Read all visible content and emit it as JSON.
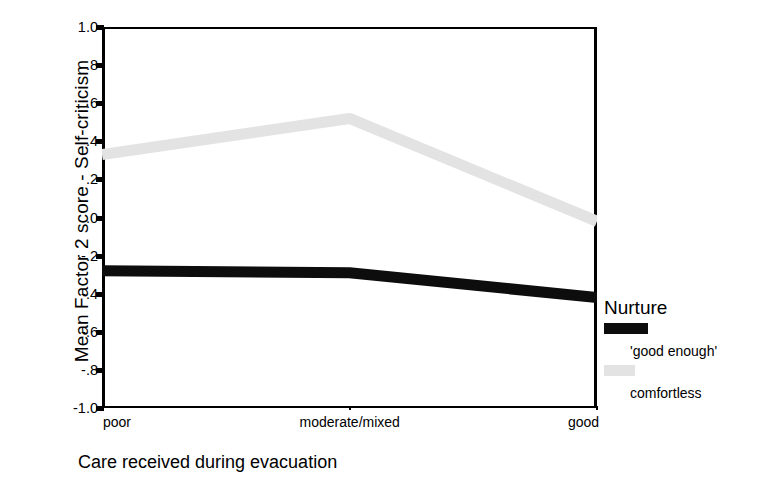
{
  "chart_data": {
    "type": "line",
    "title": "",
    "xlabel": "Care received during evacuation",
    "ylabel": "Mean Factor 2 score - Self-criticism",
    "categories": [
      "poor",
      "moderate/mixed",
      "good"
    ],
    "ylim": [
      -1.0,
      1.0
    ],
    "ytick_labels": [
      "1.0",
      ".8",
      ".6",
      ".4",
      ".2",
      ".0",
      "-.2",
      "-.4",
      "-.6",
      "-.8",
      "-1.0"
    ],
    "ytick_values": [
      1.0,
      0.8,
      0.6,
      0.4,
      0.2,
      0.0,
      -0.2,
      -0.4,
      -0.6,
      -0.8,
      -1.0
    ],
    "grid": false,
    "legend_position": "right",
    "legend_title": "Nurture",
    "series": [
      {
        "name": "'good enough'",
        "color": "#0d0d0d",
        "values": [
          -0.28,
          -0.29,
          -0.42
        ]
      },
      {
        "name": "comfortless",
        "color": "#e3e3e3",
        "values": [
          0.33,
          0.52,
          -0.02
        ]
      }
    ]
  },
  "axes": {
    "y_title": "Mean Factor 2 score - Self-criticism",
    "x_title": "Care received during evacuation"
  },
  "legend": {
    "title": "Nurture",
    "entries": [
      {
        "label": "'good enough'",
        "color": "#0d0d0d"
      },
      {
        "label": "comfortless",
        "color": "#e3e3e3"
      }
    ]
  }
}
